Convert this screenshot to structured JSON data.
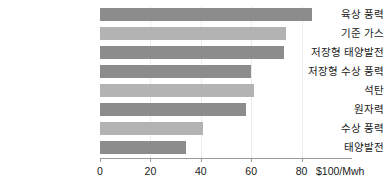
{
  "chart_data": {
    "type": "bar",
    "orientation": "horizontal",
    "title": "",
    "xlabel": "$100/Mwh",
    "ylabel": "",
    "xlim": [
      0,
      100
    ],
    "xticks": [
      0,
      20,
      40,
      60,
      80
    ],
    "xtick_labels": [
      "0",
      "20",
      "40",
      "60",
      "80"
    ],
    "grid": true,
    "grid_axis": "x",
    "legend": "none",
    "axis_unit_label": "$100/Mwh",
    "categories": [
      "육상 풍력",
      "기준 가스",
      "저장형 태양발전",
      "저장형 수상 풍력",
      "석탄",
      "원자력",
      "수상 풍력",
      "태양발전"
    ],
    "values": [
      84,
      74,
      73,
      60,
      61,
      58,
      41,
      34
    ],
    "bar_colors": [
      "#8c8c8c",
      "#b3b3b3",
      "#8c8c8c",
      "#8c8c8c",
      "#b3b3b3",
      "#8c8c8c",
      "#b3b3b3",
      "#8c8c8c"
    ],
    "colors": {
      "bar_dark": "#8c8c8c",
      "bar_light": "#b3b3b3",
      "axis": "#9a9a9a",
      "gridline": "#ececec",
      "text": "#1a1a1a",
      "background": "#ffffff"
    }
  }
}
